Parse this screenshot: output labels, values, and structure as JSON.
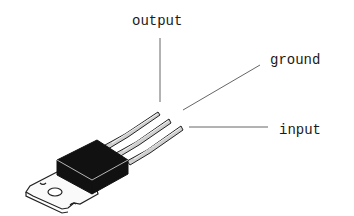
{
  "diagram": {
    "labels": {
      "output": "output",
      "ground": "ground",
      "input": "input"
    },
    "colors": {
      "background": "#ffffff",
      "body": "#111111",
      "line": "#555555",
      "text": "#1a1a1a"
    }
  }
}
